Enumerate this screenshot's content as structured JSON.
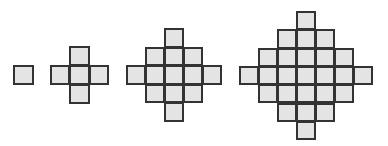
{
  "diagram": {
    "colors": {
      "fill": "#e4e4e4",
      "border": "#333333",
      "background": "#ffffff"
    },
    "figures": [
      {
        "name": "figure-1",
        "left": 13,
        "top": 65,
        "cw": 20,
        "ch": 19,
        "rows": [
          [
            0,
            1
          ]
        ]
      },
      {
        "name": "figure-2",
        "left": 50,
        "top": 46,
        "cw": 19.3,
        "ch": 19,
        "rows": [
          [
            1,
            1
          ],
          [
            0,
            3
          ],
          [
            1,
            1
          ]
        ]
      },
      {
        "name": "figure-3",
        "left": 126,
        "top": 28,
        "cw": 19,
        "ch": 18.6,
        "rows": [
          [
            2,
            1
          ],
          [
            1,
            3
          ],
          [
            0,
            5
          ],
          [
            1,
            3
          ],
          [
            2,
            1
          ]
        ]
      },
      {
        "name": "figure-4",
        "left": 239,
        "top": 11,
        "cw": 19,
        "ch": 18.3,
        "rows": [
          [
            3,
            1
          ],
          [
            2,
            3
          ],
          [
            1,
            5
          ],
          [
            0,
            7
          ],
          [
            1,
            5
          ],
          [
            2,
            3
          ],
          [
            3,
            1
          ]
        ]
      }
    ],
    "tile_counts": [
      1,
      5,
      13,
      25
    ]
  }
}
